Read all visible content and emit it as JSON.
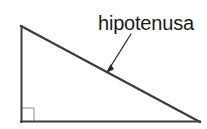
{
  "diagram": {
    "background_color": "#ffffff",
    "label": {
      "text": "hipotenusa",
      "color": "#1a1a1a",
      "x": 98,
      "y": 30,
      "font_size": 20
    },
    "shape": {
      "type": "right-triangle",
      "stroke_color": "#3d3d3d",
      "stroke_width": 2,
      "vertices": {
        "apex": {
          "x": 21,
          "y": 26
        },
        "right_angle": {
          "x": 21,
          "y": 122
        },
        "base_end": {
          "x": 200,
          "y": 122
        }
      },
      "sides": {
        "vertical_leg": {
          "name": "cateto-vertical",
          "from": "apex",
          "to": "right_angle"
        },
        "horizontal_leg": {
          "name": "cateto-horizontal",
          "from": "right_angle",
          "to": "base_end"
        },
        "hypotenuse": {
          "name": "hipotenusa",
          "from": "apex",
          "to": "base_end"
        }
      }
    },
    "right_angle_marker": {
      "name": "right-angle-square",
      "x": 21,
      "y": 108,
      "size": 13,
      "stroke_color": "#8c8c8c",
      "stroke_width": 1
    },
    "arrow": {
      "name": "hypotenuse-pointer",
      "from": {
        "x": 131,
        "y": 34
      },
      "to": {
        "x": 107,
        "y": 72
      },
      "stroke_color": "#2b2b2b",
      "stroke_width": 1.3
    }
  }
}
